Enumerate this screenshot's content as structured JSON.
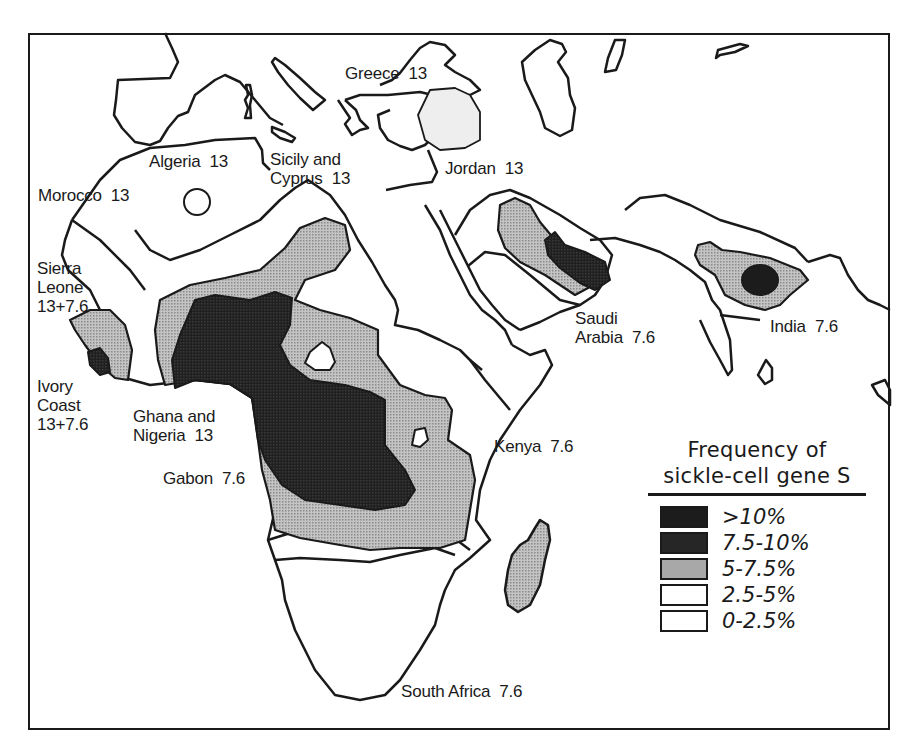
{
  "map": {
    "title": "Frequency of sickle-cell gene S",
    "region": "Africa, Mediterranean, Middle East and India",
    "colors": {
      "very_high": "#1c1c1c",
      "high": "#262626",
      "medium": "#a8a8a8",
      "low": "#ffffff",
      "very_low": "#ffffff",
      "outline": "#1a1a1a",
      "light_shade": "#ececec"
    },
    "labels": [
      {
        "id": "greece",
        "text": "Greece  13",
        "x": 345,
        "y": 70
      },
      {
        "id": "algeria",
        "text": "Algeria  13",
        "x": 149,
        "y": 158
      },
      {
        "id": "sicily-cyprus",
        "text": "Sicily and\nCyprus  13",
        "x": 270,
        "y": 151
      },
      {
        "id": "jordan",
        "text": "Jordan  13",
        "x": 445,
        "y": 158
      },
      {
        "id": "morocco",
        "text": "Morocco  13",
        "x": 38,
        "y": 185
      },
      {
        "id": "sierra-leone",
        "text": "Sierra\nLeone\n13+7.6",
        "x": 37,
        "y": 258
      },
      {
        "id": "ivory-coast",
        "text": "Ivory\nCoast\n13+7.6",
        "x": 37,
        "y": 376
      },
      {
        "id": "ghana-nigeria",
        "text": "Ghana and\nNigeria  13",
        "x": 133,
        "y": 406
      },
      {
        "id": "gabon",
        "text": "Gabon  7.6",
        "x": 163,
        "y": 468
      },
      {
        "id": "saudi-arabia",
        "text": "Saudi\nArabia  7.6",
        "x": 575,
        "y": 309
      },
      {
        "id": "india",
        "text": "India  7.6",
        "x": 770,
        "y": 317
      },
      {
        "id": "kenya",
        "text": "Kenya  7.6",
        "x": 494,
        "y": 436
      },
      {
        "id": "south-africa",
        "text": "South Africa  7.6",
        "x": 401,
        "y": 682
      }
    ]
  },
  "legend": {
    "title_line1": "Frequency of",
    "title_line2": "sickle-cell gene S",
    "items": [
      {
        "label": ">10%",
        "fill": "#1c1c1c"
      },
      {
        "label": "7.5-10%",
        "fill": "#262626"
      },
      {
        "label": "5-7.5%",
        "fill": "#a8a8a8"
      },
      {
        "label": "2.5-5%",
        "fill": "#ffffff"
      },
      {
        "label": "0-2.5%",
        "fill": "#ffffff"
      }
    ]
  }
}
